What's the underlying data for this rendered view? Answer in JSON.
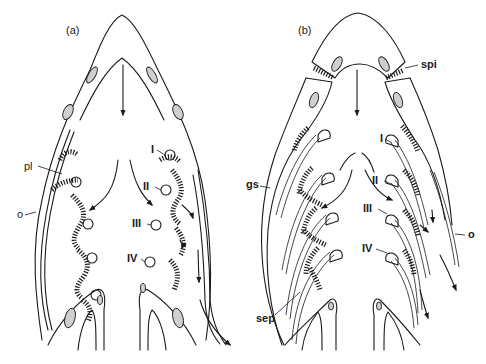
{
  "figure": {
    "panels": [
      {
        "id": "a",
        "label": "(a)",
        "annotations": {
          "pl": "pl",
          "o": "o",
          "arch_1": "I",
          "arch_2": "II",
          "arch_3": "III",
          "arch_4": "IV"
        }
      },
      {
        "id": "b",
        "label": "(b)",
        "annotations": {
          "spi": "spi",
          "gs": "gs",
          "sep": "sep",
          "o": "o",
          "arch_1": "I",
          "arch_2": "II",
          "arch_3": "III",
          "arch_4": "IV"
        }
      }
    ],
    "colors": {
      "line": "#1a1a1a",
      "stipple": "#cfcfcf",
      "background": "#ffffff"
    }
  }
}
